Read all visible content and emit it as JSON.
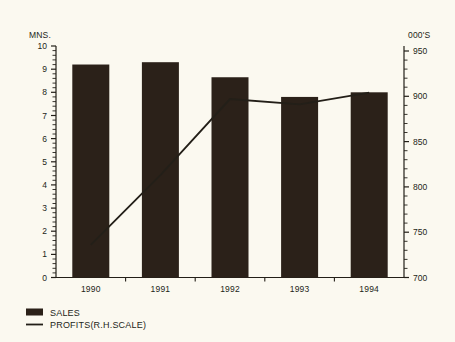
{
  "chart_data": {
    "type": "bar",
    "title": "",
    "subtitle": "",
    "categories": [
      "1990",
      "1991",
      "1992",
      "1993",
      "1994"
    ],
    "series": [
      {
        "name": "SALES",
        "type": "bar",
        "axis": "left",
        "values": [
          9.2,
          9.3,
          8.65,
          7.8,
          8.0
        ]
      },
      {
        "name": "PROFITS(R.H.SCALE)",
        "type": "line",
        "axis": "right",
        "values": [
          736,
          813,
          897,
          891,
          904
        ]
      }
    ],
    "xlabel": "",
    "ylabel": "MNS.",
    "y2label": "000'S",
    "ylim": [
      0,
      10
    ],
    "y2lim": [
      700,
      950
    ],
    "yticks": [
      0,
      1,
      2,
      3,
      4,
      5,
      6,
      7,
      8,
      9,
      10
    ],
    "y2ticks": [
      700,
      750,
      800,
      850,
      900,
      950
    ],
    "grid": false,
    "legend_position": "bottom-left",
    "colors": {
      "bar": "#2b2119",
      "line": "#231f18",
      "axis": "#231f18",
      "background": "#fbf9f0"
    }
  },
  "axes": {
    "left_unit_label": "MNS.",
    "right_unit_label": "000'S",
    "left_tick_labels": [
      "10",
      "9",
      "8",
      "7",
      "6",
      "5",
      "4",
      "3",
      "2",
      "1",
      "0"
    ],
    "right_tick_labels": [
      "950",
      "900",
      "850",
      "800",
      "750",
      "700"
    ],
    "category_labels": [
      "1990",
      "1991",
      "1992",
      "1993",
      "1994"
    ]
  },
  "legend": {
    "items": [
      {
        "label": "SALES",
        "marker": "filled-square-swatch"
      },
      {
        "label": "PROFITS(R.H.SCALE)",
        "marker": "line-swatch"
      }
    ]
  }
}
